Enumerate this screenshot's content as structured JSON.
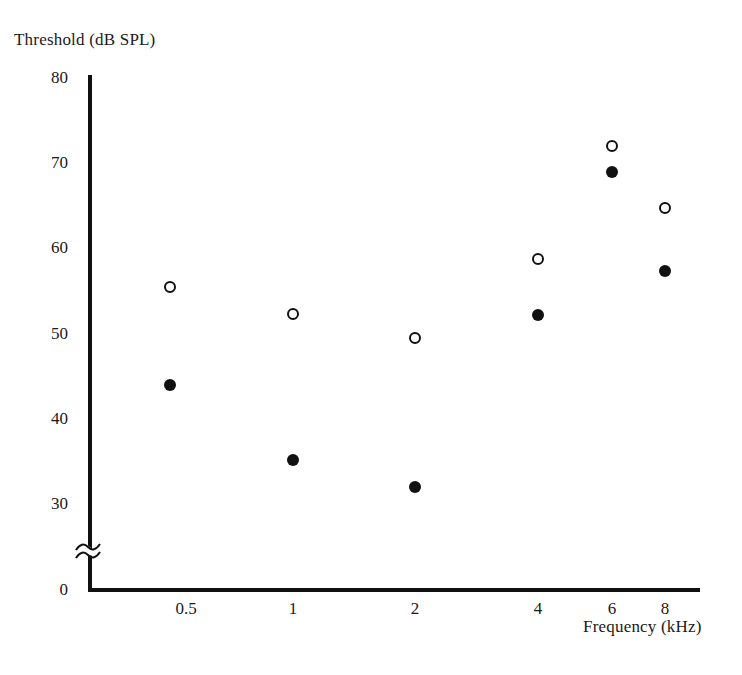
{
  "chart_data": {
    "type": "scatter",
    "title": "",
    "xlabel": "Frequency (kHz)",
    "ylabel": "Threshold (dB SPL)",
    "x_tick_labels": [
      "0.5",
      "1",
      "2",
      "4",
      "6",
      "8"
    ],
    "x_values": [
      0.5,
      1,
      2,
      4,
      6,
      8
    ],
    "x_scale": "log",
    "y_tick_labels": [
      "80",
      "70",
      "60",
      "50",
      "40",
      "30",
      "0"
    ],
    "y_ticks": [
      80,
      70,
      60,
      50,
      40,
      30,
      0
    ],
    "ylim": [
      0,
      80
    ],
    "y_axis_broken": true,
    "y_axis_break_between": [
      0,
      30
    ],
    "grid": false,
    "legend": "none",
    "series": [
      {
        "name": "open-circle-series",
        "marker": "open-circle",
        "color": "#111111",
        "values": [
          55.5,
          52.3,
          49.5,
          58.8,
          72.0,
          64.8
        ]
      },
      {
        "name": "filled-circle-series",
        "marker": "filled-circle",
        "color": "#111111",
        "values": [
          44.0,
          35.2,
          32.0,
          52.2,
          69.0,
          57.4
        ]
      }
    ]
  },
  "axes": {
    "y_title": "Threshold (dB SPL)",
    "x_title": "Frequency (kHz)"
  }
}
